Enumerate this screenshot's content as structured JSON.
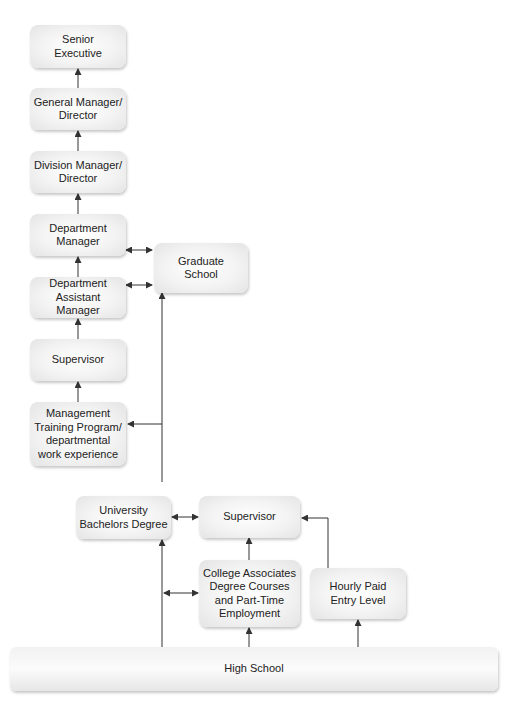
{
  "diagram": {
    "type": "career-path flowchart",
    "colors": {
      "box_fill": "#f1f1f1",
      "box_shadow": "#bdbdbd",
      "arrow": "#333333",
      "text": "#222222"
    },
    "nodes": {
      "senior_executive": "Senior\nExecutive",
      "general_manager": "General Manager/\nDirector",
      "division_manager": "Division Manager/\nDirector",
      "department_manager": "Department\nManager",
      "department_assistant_manager": "Department\nAssistant Manager",
      "supervisor_mgmt": "Supervisor",
      "management_training": "Management\nTraining Program/\ndepartmental\nwork experience",
      "graduate_school": "Graduate\nSchool",
      "university": "University\nBachelors Degree",
      "supervisor_entry": "Supervisor",
      "college_associates": "College Associates\nDegree Courses\nand Part-Time\nEmployment",
      "hourly_paid": "Hourly Paid\nEntry Level",
      "high_school": "High School"
    },
    "edges": [
      {
        "from": "General Manager/Director",
        "to": "Senior Executive",
        "type": "one-way"
      },
      {
        "from": "Division Manager/Director",
        "to": "General Manager/Director",
        "type": "one-way"
      },
      {
        "from": "Department Manager",
        "to": "Division Manager/Director",
        "type": "one-way"
      },
      {
        "from": "Department Assistant Manager",
        "to": "Department Manager",
        "type": "one-way"
      },
      {
        "from": "Supervisor",
        "to": "Department Assistant Manager",
        "type": "one-way"
      },
      {
        "from": "Management Training Program",
        "to": "Supervisor",
        "type": "one-way"
      },
      {
        "from": "Department Manager",
        "to": "Graduate School",
        "type": "two-way"
      },
      {
        "from": "Department Assistant Manager",
        "to": "Graduate School",
        "type": "two-way"
      },
      {
        "from": "University Bachelors Degree",
        "to": "Graduate School",
        "type": "one-way"
      },
      {
        "from": "University Bachelors Degree",
        "to": "Management Training Program",
        "type": "one-way"
      },
      {
        "from": "University Bachelors Degree",
        "to": "Supervisor (entry)",
        "type": "two-way"
      },
      {
        "from": "College Associates Degree",
        "to": "Supervisor (entry)",
        "type": "one-way"
      },
      {
        "from": "Hourly Paid Entry Level",
        "to": "Supervisor (entry)",
        "type": "one-way"
      },
      {
        "from": "High School",
        "to": "University Bachelors Degree",
        "type": "one-way"
      },
      {
        "from": "University line",
        "to": "College Associates Degree",
        "type": "two-way"
      },
      {
        "from": "High School",
        "to": "College Associates Degree",
        "type": "one-way"
      },
      {
        "from": "High School",
        "to": "Hourly Paid Entry Level",
        "type": "one-way"
      }
    ]
  }
}
